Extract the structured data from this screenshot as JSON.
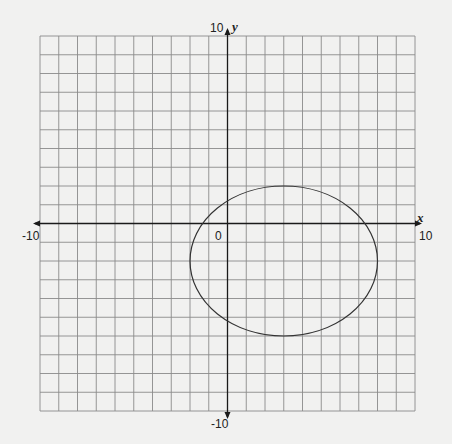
{
  "chart_data": {
    "type": "line",
    "title": "",
    "xlabel": "x",
    "ylabel": "y",
    "xlim": [
      -10,
      10
    ],
    "ylim": [
      -10,
      10
    ],
    "grid": true,
    "grid_step": 1,
    "tick_labels": {
      "x_min": "-10",
      "x_max": "10",
      "y_min": "-10",
      "y_max": "10",
      "origin": "0"
    },
    "series": [
      {
        "name": "ellipse",
        "shape": "ellipse",
        "center": [
          3,
          -2
        ],
        "semi_axis_x": 5,
        "semi_axis_y": 4,
        "equation": "(x-3)^2/25 + (y+2)^2/16 = 1"
      }
    ],
    "colors": {
      "background": "#f1f1f0",
      "grid": "#8a8a8a",
      "axis": "#1a1a1a",
      "curve": "#333333"
    }
  }
}
